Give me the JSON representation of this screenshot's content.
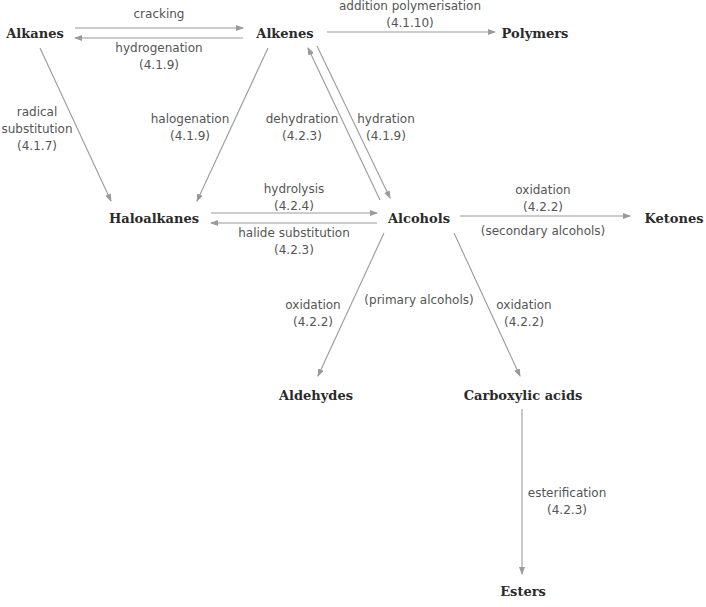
{
  "diagram": {
    "type": "reaction-pathway-map",
    "colors": {
      "arrow": "#9a9a9a",
      "node_text": "#2a2a2a",
      "label_text": "#555555"
    },
    "nodes": {
      "alkanes": "Alkanes",
      "alkenes": "Alkenes",
      "polymers": "Polymers",
      "haloalkanes": "Haloalkanes",
      "alcohols": "Alcohols",
      "ketones": "Ketones",
      "aldehydes": "Aldehydes",
      "carboxylic_acids": "Carboxylic acids",
      "esters": "Esters"
    },
    "edges": {
      "cracking": {
        "from": "Alkanes",
        "to": "Alkenes",
        "name": "cracking",
        "ref": ""
      },
      "hydrogenation": {
        "from": "Alkenes",
        "to": "Alkanes",
        "name": "hydrogenation",
        "ref": "(4.1.9)"
      },
      "addition_polymerisation": {
        "from": "Alkenes",
        "to": "Polymers",
        "name": "addition polymerisation",
        "ref": "(4.1.10)"
      },
      "radical_substitution": {
        "from": "Alkanes",
        "to": "Haloalkanes",
        "name_1": "radical",
        "name_2": "substitution",
        "ref": "(4.1.7)"
      },
      "halogenation": {
        "from": "Alkenes",
        "to": "Haloalkanes",
        "name": "halogenation",
        "ref": "(4.1.9)"
      },
      "dehydration": {
        "from": "Alcohols",
        "to": "Alkenes",
        "name": "dehydration",
        "ref": "(4.2.3)"
      },
      "hydration": {
        "from": "Alkenes",
        "to": "Alcohols",
        "name": "hydration",
        "ref": "(4.1.9)"
      },
      "hydrolysis": {
        "from": "Haloalkanes",
        "to": "Alcohols",
        "name": "hydrolysis",
        "ref": "(4.2.4)"
      },
      "halide_substitution": {
        "from": "Alcohols",
        "to": "Haloalkanes",
        "name": "halide substitution",
        "ref": "(4.2.3)"
      },
      "oxidation_ketones": {
        "from": "Alcohols",
        "to": "Ketones",
        "name": "oxidation",
        "ref": "(4.2.2)",
        "note": "(secondary alcohols)"
      },
      "oxidation_aldehydes": {
        "from": "Alcohols",
        "to": "Aldehydes",
        "name": "oxidation",
        "ref": "(4.2.2)"
      },
      "primary_note": "(primary alcohols)",
      "oxidation_acids": {
        "from": "Alcohols",
        "to": "Carboxylic acids",
        "name": "oxidation",
        "ref": "(4.2.2)"
      },
      "esterification": {
        "from": "Carboxylic acids",
        "to": "Esters",
        "name": "esterification",
        "ref": "(4.2.3)"
      }
    }
  }
}
